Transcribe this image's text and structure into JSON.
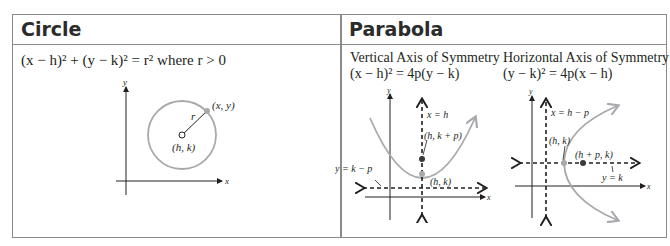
{
  "circle": {
    "title": "Circle",
    "equation": "(x − h)² + (y − k)² = r² where r > 0",
    "diagram": {
      "labels": {
        "y_axis": "y",
        "x_axis": "x",
        "point": "(x, y)",
        "radius": "r",
        "center": "(h, k)"
      },
      "colors": {
        "curve": "#a7a9ac",
        "axis": "#231f20"
      }
    }
  },
  "parabola": {
    "title": "Parabola",
    "vertical": {
      "heading": "Vertical Axis of Symmetry",
      "equation": "(x − h)² = 4p(y − k)",
      "labels": {
        "y_axis": "y",
        "x_axis": "x",
        "axis_of_symmetry": "x = h",
        "focus": "(h, k + p)",
        "vertex": "(h, k)",
        "directrix": "y = k − p"
      }
    },
    "horizontal": {
      "heading": "Horizontal Axis of Symmetry",
      "equation": "(y − k)² = 4p(x − h)",
      "labels": {
        "y_axis": "y",
        "x_axis": "x",
        "directrix": "x = h − p",
        "vertex": "(h, k)",
        "focus": "(h + p, k)",
        "axis_of_symmetry": "y = k"
      }
    },
    "colors": {
      "curve": "#a7a9ac",
      "focus_point": "#3a3a3a"
    }
  }
}
